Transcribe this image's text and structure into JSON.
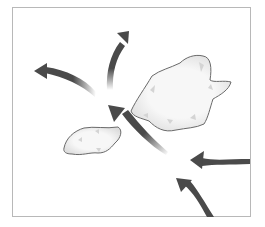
{
  "diagram": {
    "title": "",
    "frame": {
      "stroke": "#b8b8b8"
    },
    "colors": {
      "arrow": "#4a4a4a",
      "blob_fill": "#f4f4f4",
      "blob_stroke": "#6a6a6a",
      "blob_shade": "#d6d6d6"
    },
    "shapes": [
      {
        "id": "large-blob",
        "kind": "landmass"
      },
      {
        "id": "small-blob",
        "kind": "landmass"
      }
    ],
    "arrows": [
      {
        "id": "arrow-incoming-right",
        "direction": "left"
      },
      {
        "id": "arrow-incoming-bottom",
        "direction": "up-left"
      },
      {
        "id": "arrow-center",
        "direction": "up-left"
      },
      {
        "id": "arrow-up",
        "direction": "up-right"
      },
      {
        "id": "arrow-left",
        "direction": "left"
      }
    ]
  }
}
